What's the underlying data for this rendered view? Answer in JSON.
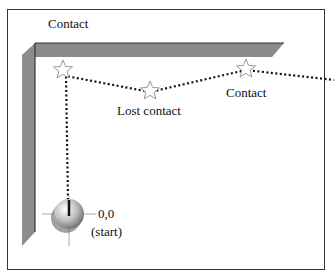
{
  "diagram": {
    "labels": {
      "contact_top": "Contact",
      "lost_contact": "Lost contact",
      "contact_right": "Contact",
      "origin": "0,0",
      "start": "(start)"
    },
    "colors": {
      "wall": "#8a8a8a",
      "wall_dark": "#6e6e6e",
      "path": "#111111",
      "star_stroke": "#9a9a9a"
    },
    "markers": [
      {
        "name": "contact-point-wall-corner",
        "type": "star"
      },
      {
        "name": "lost-contact-point",
        "type": "star"
      },
      {
        "name": "contact-point-right",
        "type": "star"
      }
    ]
  }
}
